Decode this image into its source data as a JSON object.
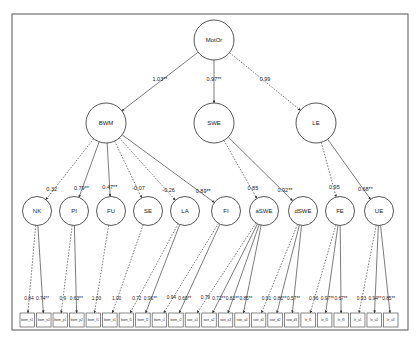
{
  "diagram": {
    "type": "structural-equation-model",
    "root": {
      "id": "MotOr",
      "label": "MotOr"
    },
    "second_order": [
      {
        "id": "BWM",
        "label": "BWM",
        "coef": "1.03**",
        "dashed": false
      },
      {
        "id": "SWE",
        "label": "SWE",
        "coef": "0.97**",
        "dashed": false
      },
      {
        "id": "LE",
        "label": "LE",
        "coef": "0.99",
        "dashed": true
      }
    ],
    "first_order": [
      {
        "id": "NK",
        "label": "NK",
        "parent": "BWM",
        "coef": "0.32",
        "dashed": true
      },
      {
        "id": "PI",
        "label": "PI",
        "parent": "BWM",
        "coef": "0.79**",
        "dashed": false
      },
      {
        "id": "FU",
        "label": "FU",
        "parent": "BWM",
        "coef": "0.47**",
        "dashed": false
      },
      {
        "id": "SE",
        "label": "SE",
        "parent": "BWM",
        "coef": "-0.07",
        "dashed": true
      },
      {
        "id": "LA",
        "label": "LA",
        "parent": "BWM",
        "coef": "-0.26",
        "dashed": true
      },
      {
        "id": "FI",
        "label": "FI",
        "parent": "BWM",
        "coef": "0.89**",
        "dashed": false
      },
      {
        "id": "aSWE",
        "label": "aSWE",
        "parent": "SWE",
        "coef": "0.85",
        "dashed": true
      },
      {
        "id": "dSWE",
        "label": "dSWE",
        "parent": "SWE",
        "coef": "0.92**",
        "dashed": false
      },
      {
        "id": "FE",
        "label": "FE",
        "parent": "LE",
        "coef": "0.95",
        "dashed": true
      },
      {
        "id": "UE",
        "label": "UE",
        "parent": "LE",
        "coef": "0.68**",
        "dashed": false
      }
    ],
    "indicators": [
      {
        "label": "bwm_n1",
        "parent": "NK",
        "coef": "0.84",
        "dashed": true
      },
      {
        "label": "bwm_n2",
        "parent": "NK",
        "coef": "0.74**",
        "dashed": false
      },
      {
        "label": "bwm_p1",
        "parent": "PI",
        "coef": "0.9",
        "dashed": true
      },
      {
        "label": "bwm_p2",
        "parent": "PI",
        "coef": "0.63**",
        "dashed": false
      },
      {
        "label": "bwm_f1",
        "parent": "FU",
        "coef": "1.00",
        "dashed": true
      },
      {
        "label": "bwm_s1",
        "parent": "SE",
        "coef": "1.00",
        "dashed": true
      },
      {
        "label": "bwm_l1",
        "parent": "LA",
        "coef": "0.72",
        "dashed": true
      },
      {
        "label": "bwm_l2",
        "parent": "LA",
        "coef": "0.96**",
        "dashed": false
      },
      {
        "label": "bwm_i1",
        "parent": "FI",
        "coef": "0.94",
        "dashed": true
      },
      {
        "label": "bwm_i2",
        "parent": "FI",
        "coef": "0.69**",
        "dashed": false
      },
      {
        "label": "swe_a1",
        "parent": "aSWE",
        "coef": "0.79",
        "dashed": true
      },
      {
        "label": "swe_a2",
        "parent": "aSWE",
        "coef": "0.72**",
        "dashed": false
      },
      {
        "label": "swe_a3",
        "parent": "aSWE",
        "coef": "0.83**",
        "dashed": false
      },
      {
        "label": "swe_a4",
        "parent": "aSWE",
        "coef": "0.85**",
        "dashed": false
      },
      {
        "label": "swe_d1",
        "parent": "dSWE",
        "coef": "0.91",
        "dashed": true
      },
      {
        "label": "swe_d2",
        "parent": "dSWE",
        "coef": "0.86**",
        "dashed": false
      },
      {
        "label": "swe_d3",
        "parent": "dSWE",
        "coef": "0.57**",
        "dashed": false
      },
      {
        "label": "le_f1",
        "parent": "FE",
        "coef": "0.96",
        "dashed": true
      },
      {
        "label": "le_f2",
        "parent": "FE",
        "coef": "0.97**",
        "dashed": false
      },
      {
        "label": "le_f3",
        "parent": "FE",
        "coef": "0.67**",
        "dashed": false
      },
      {
        "label": "le_u1",
        "parent": "UE",
        "coef": "0.93",
        "dashed": true
      },
      {
        "label": "le_u2",
        "parent": "UE",
        "coef": "0.94**",
        "dashed": false
      },
      {
        "label": "le_u3",
        "parent": "UE",
        "coef": "0.85**",
        "dashed": false
      }
    ]
  }
}
